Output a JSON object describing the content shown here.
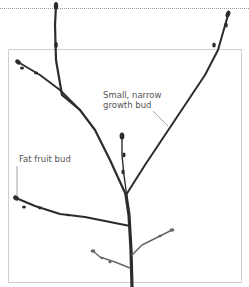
{
  "labels": {
    "growth_bud_line1": "Small, narrow",
    "growth_bud_line2": "growth bud",
    "fruit_bud": "Fat fruit bud"
  },
  "colors": {
    "branch": "#2f2a2e",
    "label_text": "#555555",
    "leader_line": "#666666",
    "frame": "#cfcfcf"
  }
}
